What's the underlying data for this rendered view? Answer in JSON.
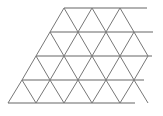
{
  "diagram": {
    "type": "triangular-grid",
    "colors": {
      "background": "#ffffff",
      "line": "#777777"
    },
    "rows": 4,
    "columns": 4,
    "cell_width": 28,
    "cell_height": 24,
    "horizontal_lines": [
      {
        "y": 8,
        "x1": 64,
        "x2": 147
      },
      {
        "y": 32,
        "x1": 50,
        "x2": 153
      },
      {
        "y": 56,
        "x1": 36,
        "x2": 152
      },
      {
        "y": 80,
        "x1": 22,
        "x2": 144
      },
      {
        "y": 103,
        "x1": 8,
        "x2": 135
      }
    ]
  }
}
